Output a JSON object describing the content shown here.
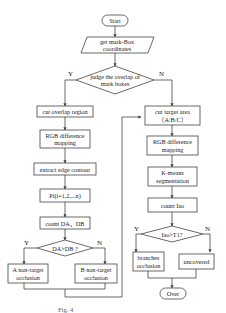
{
  "nodes": {
    "start": "Start",
    "get_coords_1": "get mark-Box",
    "get_coords_2": "coordinates",
    "judge_1": "judge the overlap of",
    "judge_2": "mark boxes",
    "cut_overlap": "cut overlap region",
    "rgb_left_1": "RGB difference",
    "rgb_left_2": "mapping",
    "extract_edge": "extract edge contour",
    "pi": "Pi(i=1,2,...n)",
    "count_da_db": "count DA、DB",
    "da_db_decision": "DA>DB ?",
    "a_occ_1": "A non-target",
    "a_occ_2": "occlusion",
    "b_occ_1": "B non-target",
    "b_occ_2": "occlusion",
    "cut_target_1": "cut target area",
    "cut_target_2": "（A/B/C）",
    "rgb_right_1": "RGB difference",
    "rgb_right_2": "mapping",
    "kmeans_1": "K-means",
    "kmeans_2": "segmentation",
    "count_iao": "count Iao",
    "iao_decision": "Iao>T1?",
    "branches_1": "branches",
    "branches_2": "occlusion",
    "uncovered": "uncovered",
    "over": "Over"
  },
  "edge_labels": {
    "judge_yes": "Y",
    "judge_no": "N",
    "da_yes": "Y",
    "da_no": "N",
    "iao_yes": "Y",
    "iao_no": "N"
  },
  "caption": "Fig. 4"
}
